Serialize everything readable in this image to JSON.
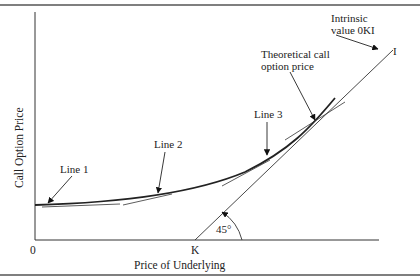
{
  "figure": {
    "type": "diagram",
    "axes": {
      "x_label": "Price of Underlying",
      "y_label": "Call Option Price",
      "origin_label": "0",
      "strike_label": "K"
    },
    "intrinsic_line": {
      "end_label": "I",
      "annotation_line1": "Intrinsic",
      "annotation_line2": "value 0KI",
      "angle_label": "45°"
    },
    "curve": {
      "annotation_line1": "Theoretical call",
      "annotation_line2": "option price"
    },
    "tangent_lines": [
      {
        "label": "Line 1"
      },
      {
        "label": "Line 2"
      },
      {
        "label": "Line 3"
      }
    ],
    "colors": {
      "line": "#222222",
      "border": "#555555"
    }
  }
}
